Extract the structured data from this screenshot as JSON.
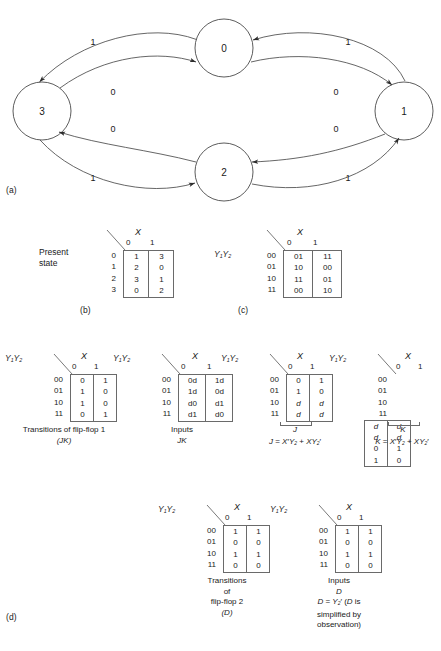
{
  "figure": {
    "parts": {
      "a": "(a)",
      "b": "(b)",
      "c": "(c)",
      "d": "(d)"
    }
  },
  "state_diagram": {
    "states": [
      {
        "id": "0",
        "label": "0"
      },
      {
        "id": "1",
        "label": "1"
      },
      {
        "id": "2",
        "label": "2"
      },
      {
        "id": "3",
        "label": "3"
      }
    ],
    "transitions": [
      {
        "from": "0",
        "to": "3",
        "label": "1"
      },
      {
        "from": "3",
        "to": "0",
        "label": "0"
      },
      {
        "from": "1",
        "to": "0",
        "label": "1"
      },
      {
        "from": "0",
        "to": "1",
        "label": "0"
      },
      {
        "from": "2",
        "to": "3",
        "label": "0"
      },
      {
        "from": "3",
        "to": "2",
        "label": "1"
      },
      {
        "from": "1",
        "to": "2",
        "label": "0"
      },
      {
        "from": "2",
        "to": "1",
        "label": "1"
      }
    ]
  },
  "table_b": {
    "side_label": "Present\nstate",
    "side_label_line1": "Present",
    "side_label_line2": "state",
    "x_label": "X",
    "columns": [
      "0",
      "1"
    ],
    "rows": [
      "0",
      "1",
      "2",
      "3"
    ],
    "cells": [
      [
        "1",
        "3"
      ],
      [
        "2",
        "0"
      ],
      [
        "3",
        "1"
      ],
      [
        "0",
        "2"
      ]
    ]
  },
  "table_c": {
    "side_label_y": "Y",
    "side_label_y1sub": "1",
    "side_label_y2": "Y",
    "side_label_y2sub": "2",
    "x_label": "X",
    "columns": [
      "0",
      "1"
    ],
    "rows": [
      "00",
      "01",
      "10",
      "11"
    ],
    "cells": [
      [
        "01",
        "11"
      ],
      [
        "10",
        "00"
      ],
      [
        "11",
        "01"
      ],
      [
        "00",
        "10"
      ]
    ]
  },
  "table_d1": {
    "x_label": "X",
    "columns": [
      "0",
      "1"
    ],
    "rows": [
      "00",
      "01",
      "10",
      "11"
    ],
    "cells": [
      [
        "0",
        "1"
      ],
      [
        "1",
        "0"
      ],
      [
        "1",
        "0"
      ],
      [
        "0",
        "1"
      ]
    ],
    "caption_line1": "Transitions of flip-flop 1",
    "caption_line2": "(JK)"
  },
  "table_d2": {
    "x_label": "X",
    "columns": [
      "0",
      "1"
    ],
    "rows": [
      "00",
      "01",
      "10",
      "11"
    ],
    "cells": [
      [
        "0d",
        "1d"
      ],
      [
        "1d",
        "0d"
      ],
      [
        "d0",
        "d1"
      ],
      [
        "d1",
        "d0"
      ]
    ],
    "caption_line1": "Inputs",
    "caption_line2": "JK"
  },
  "table_d3": {
    "x_label": "X",
    "columns": [
      "0",
      "1"
    ],
    "rows": [
      "00",
      "01",
      "10",
      "11"
    ],
    "cells": [
      [
        "0",
        "1"
      ],
      [
        "1",
        "0"
      ],
      [
        "d",
        "d"
      ],
      [
        "d",
        "d"
      ]
    ],
    "brace_label": "J",
    "equation": "J = X'Y2 + XY2'"
  },
  "table_d4": {
    "x_label": "X",
    "columns": [
      "0",
      "1"
    ],
    "rows": [
      "00",
      "01",
      "10",
      "11"
    ],
    "cells": [
      [
        "d",
        "d"
      ],
      [
        "d",
        "d"
      ],
      [
        "0",
        "1"
      ],
      [
        "1",
        "0"
      ]
    ],
    "brace_label": "K",
    "equation": "K = X'Y2 + XY2'"
  },
  "table_d5": {
    "x_label": "X",
    "columns": [
      "0",
      "1"
    ],
    "rows": [
      "00",
      "01",
      "10",
      "11"
    ],
    "cells": [
      [
        "1",
        "1"
      ],
      [
        "0",
        "0"
      ],
      [
        "1",
        "1"
      ],
      [
        "0",
        "0"
      ]
    ],
    "caption_line1": "Transitions",
    "caption_line2": "of",
    "caption_line3": "flip-flop 2",
    "caption_line4": "(D)"
  },
  "table_d6": {
    "x_label": "X",
    "columns": [
      "0",
      "1"
    ],
    "rows": [
      "00",
      "01",
      "10",
      "11"
    ],
    "cells": [
      [
        "1",
        "1"
      ],
      [
        "0",
        "0"
      ],
      [
        "1",
        "1"
      ],
      [
        "0",
        "0"
      ]
    ],
    "caption_line1": "Inputs",
    "caption_line2": "D",
    "caption_line3": "D = Y2' (D is",
    "caption_line4": "simplified by",
    "caption_line5": "observation)"
  }
}
